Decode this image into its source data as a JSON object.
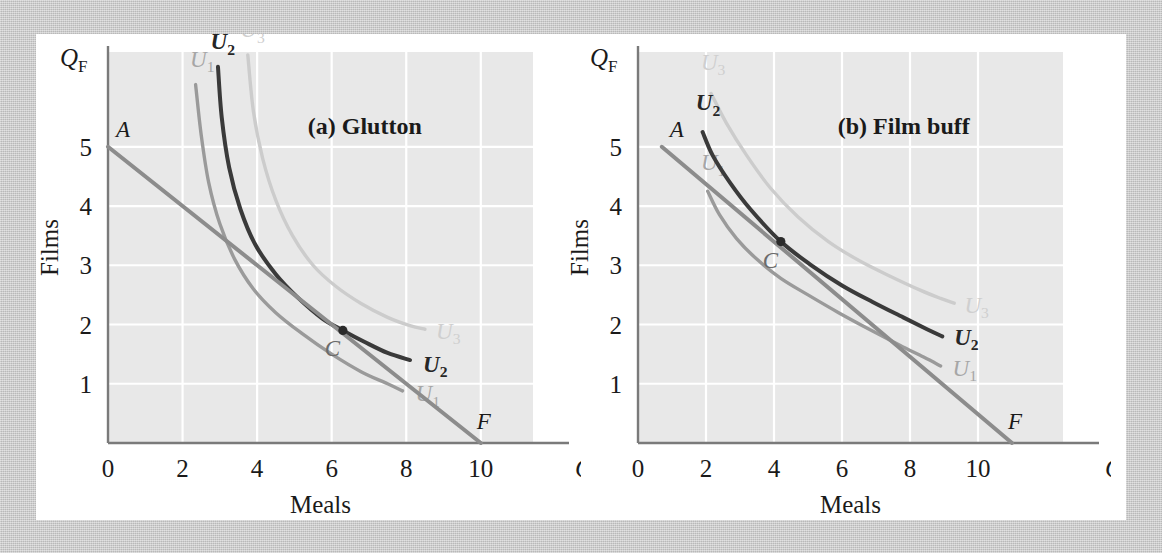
{
  "figure": {
    "background_color": "#c9c9c9",
    "content_background": "#ffffff",
    "plot_background": "#e8e8e8",
    "gridline_color": "#ffffff",
    "axis_color": "#7a7a7a"
  },
  "colors": {
    "u1": "#9a9a9a",
    "u2": "#3a3a3a",
    "u3": "#cccccc",
    "budget_line": "#8c8c8c",
    "point": "#2b2b2b",
    "text": "#1a1a1a",
    "label_u1": "#a6a6a6",
    "label_u2": "#262626",
    "label_u3": "#cfcfcf"
  },
  "panels": [
    {
      "id": "a",
      "title": "(a) Glutton",
      "axis": {
        "x_label_symbol": "Q",
        "x_label_sub": "M",
        "y_label_symbol": "Q",
        "y_label_sub": "F",
        "x_axis_name": "Meals",
        "y_axis_name": "Films",
        "x_ticks": [
          "0",
          "2",
          "4",
          "6",
          "8",
          "10"
        ],
        "x_tick_values": [
          0,
          2,
          4,
          6,
          8,
          10
        ],
        "y_ticks": [
          "0",
          "1",
          "2",
          "3",
          "4",
          "5"
        ],
        "y_tick_values": [
          0,
          1,
          2,
          3,
          4,
          5
        ],
        "xlim": [
          0,
          11.4
        ],
        "ylim": [
          0,
          6.6
        ]
      },
      "budget_line": {
        "label_start": "A",
        "label_end": "F",
        "start": [
          0,
          5
        ],
        "end": [
          10,
          0
        ]
      },
      "optimum_point": {
        "label": "C",
        "x": 6.3,
        "y": 1.9
      },
      "curves": [
        {
          "name": "U1",
          "label": "U",
          "label_sub": "1",
          "color_key": "u1",
          "points": [
            [
              2.35,
              6.05
            ],
            [
              2.5,
              5.2
            ],
            [
              2.7,
              4.4
            ],
            [
              3.0,
              3.7
            ],
            [
              3.4,
              3.1
            ],
            [
              3.9,
              2.6
            ],
            [
              4.5,
              2.2
            ],
            [
              5.2,
              1.85
            ],
            [
              6.0,
              1.5
            ],
            [
              6.8,
              1.2
            ],
            [
              7.5,
              1.0
            ],
            [
              7.9,
              0.88
            ]
          ],
          "label_start_pos": [
            2.2,
            6.35
          ],
          "label_end_pos": [
            8.25,
            0.82
          ]
        },
        {
          "name": "U2",
          "label": "U",
          "label_sub": "2",
          "color_key": "u2",
          "points": [
            [
              2.95,
              6.35
            ],
            [
              3.05,
              5.5
            ],
            [
              3.25,
              4.65
            ],
            [
              3.55,
              3.95
            ],
            [
              3.95,
              3.35
            ],
            [
              4.5,
              2.85
            ],
            [
              5.1,
              2.45
            ],
            [
              5.75,
              2.1
            ],
            [
              6.3,
              1.9
            ],
            [
              6.9,
              1.7
            ],
            [
              7.5,
              1.52
            ],
            [
              8.1,
              1.4
            ]
          ],
          "label_start_pos": [
            2.75,
            6.65
          ],
          "label_end_pos": [
            8.45,
            1.32
          ]
        },
        {
          "name": "U3",
          "label": "U",
          "label_sub": "3",
          "color_key": "u3",
          "points": [
            [
              3.75,
              6.55
            ],
            [
              3.9,
              5.6
            ],
            [
              4.15,
              4.8
            ],
            [
              4.5,
              4.1
            ],
            [
              4.95,
              3.5
            ],
            [
              5.5,
              3.0
            ],
            [
              6.1,
              2.65
            ],
            [
              6.8,
              2.35
            ],
            [
              7.5,
              2.12
            ],
            [
              8.1,
              1.98
            ],
            [
              8.5,
              1.92
            ]
          ],
          "label_start_pos": [
            3.55,
            6.85
          ],
          "label_end_pos": [
            8.8,
            1.88
          ]
        }
      ]
    },
    {
      "id": "b",
      "title": "(b) Film buff",
      "axis": {
        "x_label_symbol": "Q",
        "x_label_sub": "M",
        "y_label_symbol": "Q",
        "y_label_sub": "F",
        "x_axis_name": "Meals",
        "y_axis_name": "Films",
        "x_ticks": [
          "0",
          "2",
          "4",
          "6",
          "8",
          "10"
        ],
        "x_tick_values": [
          0,
          2,
          4,
          6,
          8,
          10
        ],
        "y_ticks": [
          "0",
          "1",
          "2",
          "3",
          "4",
          "5"
        ],
        "y_tick_values": [
          0,
          1,
          2,
          3,
          4,
          5
        ],
        "xlim": [
          0,
          12.5
        ],
        "ylim": [
          0,
          6.6
        ]
      },
      "budget_line": {
        "label_start": "A",
        "label_end": "F",
        "start": [
          0.7,
          5
        ],
        "end": [
          11,
          0
        ]
      },
      "optimum_point": {
        "label": "C",
        "x": 4.2,
        "y": 3.4
      },
      "curves": [
        {
          "name": "U1",
          "label": "U",
          "label_sub": "1",
          "color_key": "u1",
          "points": [
            [
              2.05,
              4.25
            ],
            [
              2.4,
              3.85
            ],
            [
              2.9,
              3.45
            ],
            [
              3.5,
              3.1
            ],
            [
              4.2,
              2.78
            ],
            [
              5.0,
              2.5
            ],
            [
              5.9,
              2.2
            ],
            [
              6.8,
              1.92
            ],
            [
              7.7,
              1.65
            ],
            [
              8.4,
              1.45
            ],
            [
              8.9,
              1.3
            ]
          ],
          "label_start_pos": [
            1.85,
            4.6
          ],
          "label_end_pos": [
            9.25,
            1.25
          ]
        },
        {
          "name": "U2",
          "label": "U",
          "label_sub": "2",
          "color_key": "u2",
          "points": [
            [
              1.9,
              5.25
            ],
            [
              2.2,
              4.85
            ],
            [
              2.7,
              4.4
            ],
            [
              3.3,
              3.95
            ],
            [
              4.2,
              3.4
            ],
            [
              5.1,
              3.0
            ],
            [
              6.0,
              2.66
            ],
            [
              6.9,
              2.38
            ],
            [
              7.8,
              2.12
            ],
            [
              8.5,
              1.92
            ],
            [
              8.95,
              1.8
            ]
          ],
          "label_start_pos": [
            1.7,
            5.62
          ],
          "label_end_pos": [
            9.3,
            1.78
          ]
        },
        {
          "name": "U3",
          "label": "U",
          "label_sub": "3",
          "color_key": "u3",
          "points": [
            [
              2.15,
              5.9
            ],
            [
              2.6,
              5.4
            ],
            [
              3.2,
              4.85
            ],
            [
              3.9,
              4.3
            ],
            [
              4.7,
              3.82
            ],
            [
              5.6,
              3.4
            ],
            [
              6.5,
              3.08
            ],
            [
              7.4,
              2.82
            ],
            [
              8.3,
              2.58
            ],
            [
              8.9,
              2.44
            ],
            [
              9.3,
              2.36
            ]
          ],
          "label_start_pos": [
            1.85,
            6.3
          ],
          "label_end_pos": [
            9.6,
            2.32
          ]
        }
      ]
    }
  ]
}
